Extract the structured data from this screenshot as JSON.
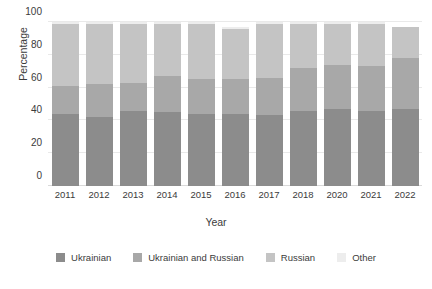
{
  "chart_data": {
    "type": "bar",
    "stacked": true,
    "title": "",
    "xlabel": "Year",
    "ylabel": "Percentage",
    "categories": [
      "2011",
      "2012",
      "2013",
      "2014",
      "2015",
      "2016",
      "2017",
      "2018",
      "2020",
      "2021",
      "2022"
    ],
    "yticks": [
      0,
      20,
      40,
      60,
      80,
      100
    ],
    "ylim": [
      0,
      100
    ],
    "grid": true,
    "legend_position": "bottom",
    "series": [
      {
        "name": "Ukrainian",
        "color": "#8c8c8c",
        "values": [
          44,
          42,
          46,
          45,
          44,
          44,
          43,
          46,
          47,
          46,
          47
        ]
      },
      {
        "name": "Ukrainian and Russian",
        "color": "#a8a8a8",
        "values": [
          17,
          20,
          17,
          22,
          21,
          21,
          23,
          26,
          27,
          27,
          31
        ]
      },
      {
        "name": "Russian",
        "color": "#c4c4c4",
        "values": [
          38,
          37,
          36,
          32,
          34,
          31,
          33,
          27,
          25,
          26,
          19
        ]
      },
      {
        "name": "Other",
        "color": "#ededed",
        "values": [
          1,
          1,
          1,
          1,
          1,
          1,
          1,
          1,
          1,
          1,
          0
        ]
      }
    ]
  }
}
